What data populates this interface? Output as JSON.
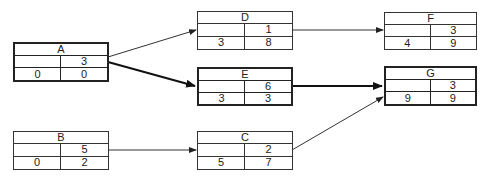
{
  "diagram": {
    "type": "activity-on-node network",
    "nodes": [
      {
        "id": "A",
        "duration": "3",
        "es": "0",
        "ef": "0",
        "critical": true
      },
      {
        "id": "B",
        "duration": "5",
        "es": "0",
        "ef": "2",
        "critical": false
      },
      {
        "id": "D",
        "duration": "1",
        "es": "3",
        "ef": "8",
        "critical": false
      },
      {
        "id": "E",
        "duration": "6",
        "es": "3",
        "ef": "3",
        "critical": true
      },
      {
        "id": "C",
        "duration": "2",
        "es": "5",
        "ef": "7",
        "critical": false
      },
      {
        "id": "F",
        "duration": "3",
        "es": "4",
        "ef": "9",
        "critical": false
      },
      {
        "id": "G",
        "duration": "3",
        "es": "9",
        "ef": "9",
        "critical": true
      }
    ],
    "edges": [
      {
        "from": "A",
        "to": "D",
        "critical": false
      },
      {
        "from": "A",
        "to": "E",
        "critical": true
      },
      {
        "from": "B",
        "to": "C",
        "critical": false
      },
      {
        "from": "D",
        "to": "F",
        "critical": false
      },
      {
        "from": "E",
        "to": "G",
        "critical": true
      },
      {
        "from": "C",
        "to": "G",
        "critical": false
      }
    ],
    "colors": {
      "line": "#333333",
      "critical": "#111111",
      "background": "#ffffff"
    }
  }
}
